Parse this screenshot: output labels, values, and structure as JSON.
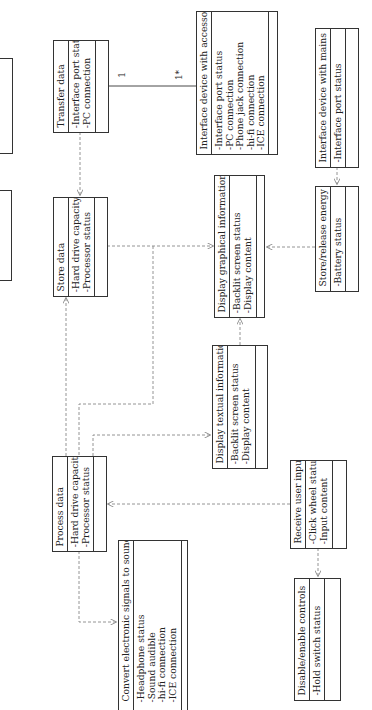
{
  "diagram": {
    "classes": {
      "partial_a": {
        "title": "",
        "attributes": []
      },
      "partial_b": {
        "title": "",
        "attributes": []
      },
      "transfer_data": {
        "title": "Transfer data",
        "attributes": [
          "-Interface port status",
          "-PC connection"
        ]
      },
      "store_data": {
        "title": "Store data",
        "attributes": [
          "-Hard drive capacity",
          "-Processor status"
        ]
      },
      "interface_accessories": {
        "title": "Interface device with accessories",
        "attributes": [
          "-Interface port status",
          "-PC connection",
          "-Phone jack connection",
          "-hi-fi connection",
          "-ICE connection"
        ]
      },
      "interface_mains": {
        "title": "Interface device with mains",
        "attributes": [
          "-Interface port status"
        ]
      },
      "display_graphical": {
        "title": "Display graphical information",
        "attributes": [
          "-Backlit screen status",
          "-Display content"
        ]
      },
      "store_energy": {
        "title": "Store/release energy",
        "attributes": [
          "-Battery status"
        ]
      },
      "display_textual": {
        "title": "Display textual information",
        "attributes": [
          "-Backlit screen status",
          "-Display content"
        ]
      },
      "process_data": {
        "title": "Process data",
        "attributes": [
          "-Hard drive capacity",
          "-Processor status"
        ]
      },
      "receive_input": {
        "title": "Receive user input",
        "attributes": [
          "-Click wheel status",
          "-Input content"
        ]
      },
      "convert_sound": {
        "title": "Convert electronic signals to sound",
        "attributes": [
          "-Headphone status",
          "-Sound audible",
          "-hi-fi connection",
          "-ICE connection"
        ]
      },
      "disable_controls": {
        "title": "Disable/enable controls",
        "attributes": [
          "-Hold switch status"
        ]
      }
    },
    "association": {
      "from": "Transfer data",
      "to": "Interface device with accessories",
      "mult_from": "1",
      "mult_to": "1*"
    },
    "colors": {
      "line": "#333333",
      "dashed": "#888888"
    }
  }
}
